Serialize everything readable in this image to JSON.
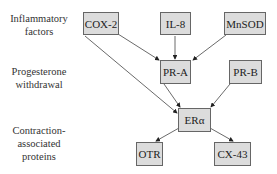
{
  "row_labels": {
    "inflammatory": "Inflammatory factors",
    "inflammatory_line1": "Inflammatory",
    "inflammatory_line2": "factors",
    "progesterone_line1": "Progesterone",
    "progesterone_line2": "withdrawal",
    "contraction_line1": "Contraction-",
    "contraction_line2": "associated",
    "contraction_line3": "proteins"
  },
  "nodes": {
    "cox2": "COX-2",
    "il8": "IL-8",
    "mnsod": "MnSOD",
    "pra": "PR-A",
    "prb": "PR-B",
    "era": "ERα",
    "otr": "OTR",
    "cx43": "CX-43"
  },
  "edges": [
    {
      "from": "COX-2",
      "to": "PR-A"
    },
    {
      "from": "IL-8",
      "to": "PR-A"
    },
    {
      "from": "MnSOD",
      "to": "PR-A"
    },
    {
      "from": "COX-2",
      "to": "ERα"
    },
    {
      "from": "PR-A",
      "to": "ERα"
    },
    {
      "from": "PR-B",
      "to": "ERα"
    },
    {
      "from": "ERα",
      "to": "OTR"
    },
    {
      "from": "ERα",
      "to": "CX-43"
    }
  ],
  "colors": {
    "node_fill": "#dcdcdc",
    "node_border": "#666666",
    "edge": "#333333"
  }
}
